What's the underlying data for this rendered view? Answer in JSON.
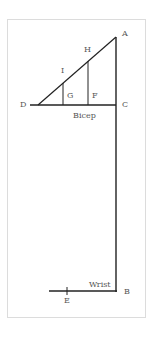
{
  "diagram": {
    "points": {
      "A": "A",
      "B": "B",
      "C": "C",
      "D": "D",
      "E": "E",
      "F": "F",
      "G": "G",
      "H": "H",
      "I": "I"
    },
    "labels": {
      "bicep": "Bicep",
      "wrist": "Wrist"
    },
    "colors": {
      "line": "#222222",
      "border": "#dcdcdc",
      "text": "#555555"
    }
  }
}
